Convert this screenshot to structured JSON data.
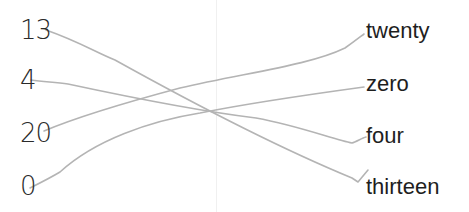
{
  "worksheet": {
    "left_items": [
      {
        "id": "n13",
        "label": "13",
        "x": 20,
        "y": 17
      },
      {
        "id": "n4",
        "label": "4",
        "x": 20,
        "y": 67
      },
      {
        "id": "n20",
        "label": "20",
        "x": 20,
        "y": 120
      },
      {
        "id": "n0",
        "label": "0",
        "x": 20,
        "y": 173
      }
    ],
    "right_items": [
      {
        "id": "w20",
        "label": "twenty",
        "x": 366,
        "y": 20
      },
      {
        "id": "w0",
        "label": "zero",
        "x": 366,
        "y": 73
      },
      {
        "id": "w4",
        "label": "four",
        "x": 366,
        "y": 125
      },
      {
        "id": "w13",
        "label": "thirteen",
        "x": 366,
        "y": 176
      }
    ],
    "matches": [
      {
        "from": "13",
        "to": "thirteen",
        "path": "M46,30 C80,42 95,52 115,60 C160,85 260,140 352,178 L358,182 L368,170"
      },
      {
        "from": "4",
        "to": "four",
        "path": "M31,80 C45,82 55,82 68,84 C110,93 190,110 256,118 C300,126 335,140 352,143 C356,142 362,138 366,137"
      },
      {
        "from": "20",
        "to": "twenty",
        "path": "M44,131 C70,120 120,104 180,88 C250,72 310,65 345,48 C355,41 360,37 364,34"
      },
      {
        "from": "0",
        "to": "zero",
        "path": "M30,188 C40,183 50,178 60,172 C95,140 150,121 200,113 C250,103 320,93 364,87"
      }
    ],
    "line_color": "#b4b4b4",
    "text_color": "#1e1e1e"
  }
}
